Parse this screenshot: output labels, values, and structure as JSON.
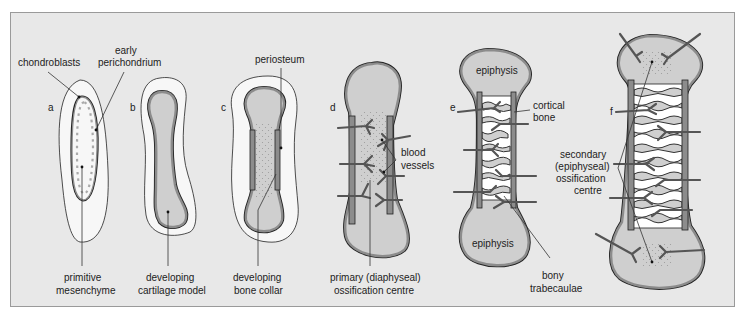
{
  "figure": {
    "colors": {
      "background": "#e8e8e8",
      "frame_border": "#9a9a9a",
      "mesenchyme_halo": "#f7f7f7",
      "cartilage_fill": "#cfcfcf",
      "perichondrium": "#8c8c8c",
      "outline": "#222222",
      "trabeculae_fill": "#ffffff",
      "vessel": "#555555"
    },
    "panels": [
      {
        "letter": "a",
        "labels": {
          "top_left": "chondroblasts",
          "top_right_line1": "early",
          "top_right_line2": "perichondrium",
          "bottom_line1": "primitive",
          "bottom_line2": "mesenchyme"
        }
      },
      {
        "letter": "b",
        "labels": {
          "bottom_line1": "developing",
          "bottom_line2": "cartilage model"
        }
      },
      {
        "letter": "c",
        "labels": {
          "top": "periosteum",
          "bottom_line1": "developing",
          "bottom_line2": "bone collar"
        }
      },
      {
        "letter": "d",
        "labels": {
          "right_line1": "blood",
          "right_line2": "vessels",
          "bottom_line1": "primary (diaphyseal)",
          "bottom_line2": "ossification centre"
        }
      },
      {
        "letter": "e",
        "labels": {
          "top_epiphysis": "epiphysis",
          "right_line1": "cortical",
          "right_line2": "bone",
          "bottom_epiphysis": "epiphysis",
          "bottom_line1": "bony",
          "bottom_line2": "trabecaulae"
        }
      },
      {
        "letter": "f",
        "labels": {
          "left_line1": "secondary",
          "left_line2": "(epiphyseal)",
          "left_line3": "ossification",
          "left_line4": "centre"
        }
      }
    ]
  }
}
